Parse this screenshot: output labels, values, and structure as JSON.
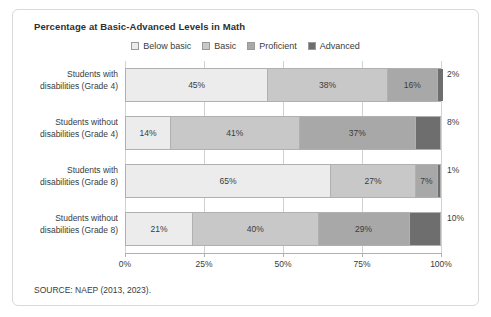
{
  "chart_data": {
    "type": "bar",
    "subtype": "stacked-horizontal-100pct",
    "title": "Percentage at Basic-Advanced Levels in Math",
    "xlabel": "",
    "ylabel": "",
    "xlim": [
      0,
      100
    ],
    "grid": true,
    "legend_position": "top-center",
    "axis_ticks": [
      "0%",
      "25%",
      "50%",
      "75%",
      "100%"
    ],
    "axis_tick_values": [
      0,
      25,
      50,
      75,
      100
    ],
    "categories": [
      "Students with disabilities (Grade 4)",
      "Students without disabilities (Grade 4)",
      "Students with disabilities (Grade 8)",
      "Students without disabilities (Grade 8)"
    ],
    "series": [
      {
        "name": "Below basic",
        "color": "#ececec",
        "values": [
          45,
          14,
          65,
          21
        ]
      },
      {
        "name": "Basic",
        "color": "#c8c8c8",
        "values": [
          38,
          41,
          27,
          40
        ]
      },
      {
        "name": "Proficient",
        "color": "#a8a8a8",
        "values": [
          16,
          37,
          7,
          29
        ]
      },
      {
        "name": "Advanced",
        "color": "#6e6e6e",
        "values": [
          2,
          8,
          1,
          10
        ]
      }
    ],
    "rows": [
      {
        "label_line1": "Students with",
        "label_line2": "disabilities (Grade 4)",
        "segments": [
          {
            "series": "Below basic",
            "value": 45,
            "label": "45%",
            "inside": true
          },
          {
            "series": "Basic",
            "value": 38,
            "label": "38%",
            "inside": true
          },
          {
            "series": "Proficient",
            "value": 16,
            "label": "16%",
            "inside": true
          },
          {
            "series": "Advanced",
            "value": 2,
            "label": "",
            "inside": false
          }
        ],
        "outer_label": "2%"
      },
      {
        "label_line1": "Students without",
        "label_line2": "disabilities (Grade 4)",
        "segments": [
          {
            "series": "Below basic",
            "value": 14,
            "label": "14%",
            "inside": true
          },
          {
            "series": "Basic",
            "value": 41,
            "label": "41%",
            "inside": true
          },
          {
            "series": "Proficient",
            "value": 37,
            "label": "37%",
            "inside": true
          },
          {
            "series": "Advanced",
            "value": 8,
            "label": "",
            "inside": false
          }
        ],
        "outer_label": "8%"
      },
      {
        "label_line1": "Students with",
        "label_line2": "disabilities (Grade 8)",
        "segments": [
          {
            "series": "Below basic",
            "value": 65,
            "label": "65%",
            "inside": true
          },
          {
            "series": "Basic",
            "value": 27,
            "label": "27%",
            "inside": true
          },
          {
            "series": "Proficient",
            "value": 7,
            "label": "7%",
            "inside": true
          },
          {
            "series": "Advanced",
            "value": 1,
            "label": "",
            "inside": false
          }
        ],
        "outer_label": "1%"
      },
      {
        "label_line1": "Students without",
        "label_line2": "disabilities (Grade 8)",
        "segments": [
          {
            "series": "Below basic",
            "value": 21,
            "label": "21%",
            "inside": true
          },
          {
            "series": "Basic",
            "value": 40,
            "label": "40%",
            "inside": true
          },
          {
            "series": "Proficient",
            "value": 29,
            "label": "29%",
            "inside": true
          },
          {
            "series": "Advanced",
            "value": 10,
            "label": "",
            "inside": false
          }
        ],
        "outer_label": "10%"
      }
    ]
  },
  "source_note": "SOURCE: NAEP (2013, 2023)."
}
